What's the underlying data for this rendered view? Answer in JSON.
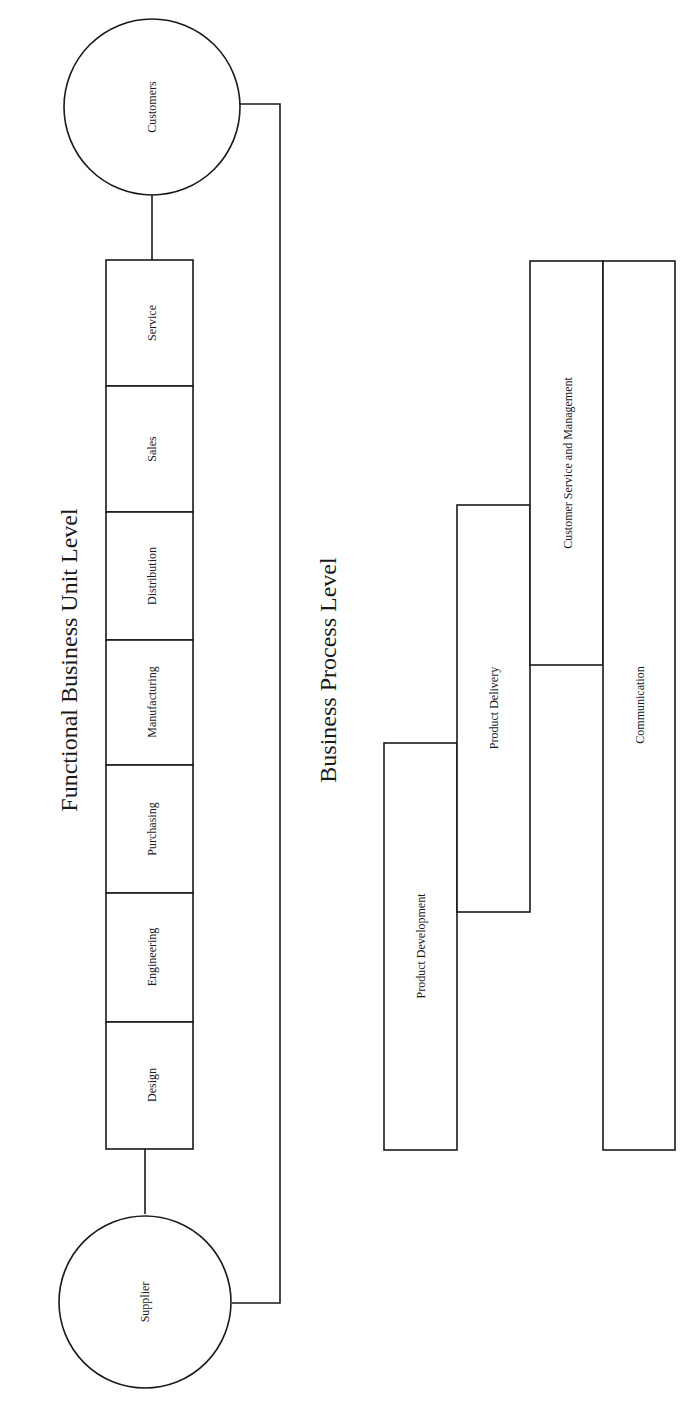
{
  "diagram": {
    "functional_level": {
      "title": "Functional Business Unit Level",
      "supplier": "Supplier",
      "customers": "Customers",
      "units": [
        "Design",
        "Engineering",
        "Purchasing",
        "Manufacturing",
        "Distribution",
        "Sales",
        "Service"
      ]
    },
    "process_level": {
      "title": "Business Process Level",
      "processes": [
        "Product Development",
        "Product Delivery",
        "Customer Service and Management",
        "Communication"
      ]
    }
  }
}
